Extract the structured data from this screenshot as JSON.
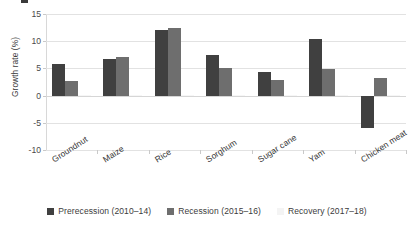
{
  "chart_data": {
    "type": "bar",
    "title": "",
    "xlabel": "",
    "ylabel": "Growth rate (%)",
    "ylim": [
      -10,
      15
    ],
    "yticks": [
      15,
      10,
      5,
      0,
      -5,
      -10
    ],
    "ytick_labels": [
      "15",
      "10",
      "5",
      "0",
      "-5",
      "-10"
    ],
    "grid": true,
    "legend_position": "bottom",
    "categories": [
      "Groundnut",
      "Maize",
      "Rice",
      "Sorghum",
      "Sugar cane",
      "Yam",
      "Chicken meat"
    ],
    "series": [
      {
        "name": "Prerecession (2010–14)",
        "color": "#404040",
        "values": [
          5.9,
          6.8,
          12.0,
          7.5,
          4.3,
          10.5,
          -6.0
        ]
      },
      {
        "name": "Recession (2015–16)",
        "color": "#6e6e6e",
        "values": [
          2.7,
          7.1,
          12.5,
          5.0,
          2.9,
          4.9,
          3.3
        ]
      },
      {
        "name": "Recovery (2017–18)",
        "color": "#f6f6f6",
        "values": [
          0.2,
          0.2,
          0.2,
          0.2,
          0.2,
          0.2,
          0.2
        ]
      }
    ]
  },
  "axis": {
    "y_title": "Growth rate (%)",
    "y_tick_labels": [
      "15",
      "10",
      "5",
      "0",
      "-5",
      "-10"
    ],
    "x_tick_labels": [
      "Groundnut",
      "Maize",
      "Rice",
      "Sorghum",
      "Sugar cane",
      "Yam",
      "Chicken meat"
    ]
  },
  "legend": {
    "items": [
      {
        "label": "Prerecession (2010–14)",
        "color": "#404040"
      },
      {
        "label": "Recession (2015–16)",
        "color": "#6e6e6e"
      },
      {
        "label": "Recovery (2017–18)",
        "color": "#f4f4f4"
      }
    ]
  },
  "colors": {
    "series_dark": "#404040",
    "series_medium": "#6e6e6e",
    "series_light": "#f6f6f6",
    "gridline": "#e2e2e2",
    "text": "#3b3b3b",
    "background": "#ffffff"
  }
}
